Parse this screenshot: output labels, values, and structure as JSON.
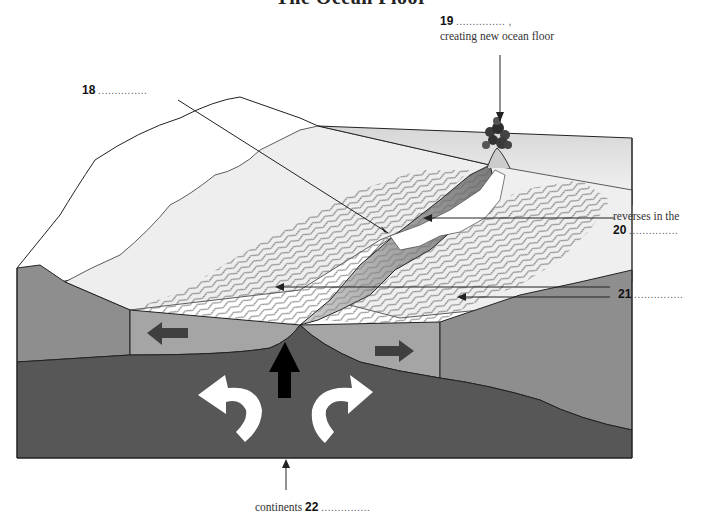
{
  "title": "The Ocean Floor",
  "labels": {
    "l18": {
      "number": "18",
      "blank": "...............",
      "text": ""
    },
    "l19": {
      "number": "19",
      "blank": "............... ,",
      "text": "creating new ocean floor"
    },
    "l20": {
      "prefix": "reverses in the",
      "number": "20",
      "blank": "..............."
    },
    "l21": {
      "number": "21",
      "blank": "..............."
    },
    "l22": {
      "prefix": "continents",
      "number": "22",
      "blank": "..............."
    }
  },
  "diagram": {
    "colors": {
      "mantle": "#555555",
      "plate": "#9a9a9a",
      "continent_side": "#8a8a8a",
      "seafloor_light": "#ececec",
      "ridge_shade": "#7d7d7d",
      "outline": "#222222",
      "arrow_dark": "#3f3f3f",
      "arrow_black": "#000000",
      "convection_arrow": "#ffffff"
    },
    "arrows": [
      {
        "name": "plate-motion-left",
        "direction": "left"
      },
      {
        "name": "plate-motion-right",
        "direction": "right"
      },
      {
        "name": "magma-upwelling",
        "direction": "up"
      },
      {
        "name": "convection-left",
        "direction": "counterclockwise-curve"
      },
      {
        "name": "convection-right",
        "direction": "clockwise-curve"
      }
    ]
  }
}
